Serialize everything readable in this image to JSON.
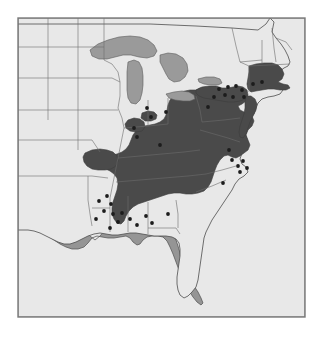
{
  "figure": {
    "type": "distribution-map",
    "region": "Eastern United States",
    "frame": {
      "x": 18,
      "y": 18,
      "width": 287,
      "height": 299
    },
    "canvas": {
      "width": 322,
      "height": 337
    }
  },
  "colors": {
    "page_background": "#ffffff",
    "ocean": "#959595",
    "land_unshaded": "#e8e8e8",
    "range_shaded": "#4a4a4a",
    "great_lakes": "#9a9a9a",
    "outline": "#4d4d4d",
    "state_border": "#6b6b6b",
    "frame_border": "#7a7a7a",
    "locality_dot": "#1c1c1c"
  },
  "legend": {
    "shaded_meaning": "Continuous distribution range (shaded dark)",
    "dot_meaning": "Isolated locality records (black dots)",
    "lake_meaning": "Great Lakes (medium gray)",
    "ocean_meaning": "Atlantic Ocean and Gulf of Mexico (medium gray)"
  },
  "map_data": {
    "shaded_states_full": [
      "Connecticut",
      "Rhode Island",
      "Massachusetts",
      "New Jersey",
      "Delaware",
      "Maryland",
      "West Virginia",
      "Kentucky",
      "Tennessee"
    ],
    "shaded_states_partial": [
      "New York",
      "Pennsylvania",
      "Ohio",
      "Indiana",
      "Illinois",
      "Virginia",
      "North Carolina",
      "South Carolina",
      "Georgia",
      "Alabama",
      "Mississippi",
      "Missouri",
      "Arkansas"
    ],
    "unshaded_states": [
      "Maine",
      "New Hampshire",
      "Vermont",
      "Michigan",
      "Wisconsin",
      "Minnesota",
      "Iowa",
      "Florida",
      "Louisiana",
      "Texas",
      "Oklahoma",
      "Kansas",
      "Nebraska",
      "South Dakota",
      "North Dakota"
    ],
    "great_lakes": [
      "Lake Superior",
      "Lake Michigan",
      "Lake Huron",
      "Lake Erie",
      "Lake Ontario"
    ],
    "locality_dot_count": 38,
    "locality_dots": [
      {
        "id": "dot-ny-01",
        "x": 219,
        "y": 89
      },
      {
        "id": "dot-ny-02",
        "x": 228,
        "y": 87
      },
      {
        "id": "dot-ny-03",
        "x": 236,
        "y": 86
      },
      {
        "id": "dot-ny-04",
        "x": 242,
        "y": 90
      },
      {
        "id": "dot-ny-05",
        "x": 225,
        "y": 95
      },
      {
        "id": "dot-ny-06",
        "x": 233,
        "y": 97
      },
      {
        "id": "dot-ny-07",
        "x": 214,
        "y": 97
      },
      {
        "id": "dot-ny-08",
        "x": 244,
        "y": 97
      },
      {
        "id": "dot-mi-01",
        "x": 147,
        "y": 108
      },
      {
        "id": "dot-in-01",
        "x": 151,
        "y": 117
      },
      {
        "id": "dot-il-01",
        "x": 134,
        "y": 128
      },
      {
        "id": "dot-il-02",
        "x": 137,
        "y": 137
      },
      {
        "id": "dot-ar-01",
        "x": 107,
        "y": 196
      },
      {
        "id": "dot-ar-02",
        "x": 99,
        "y": 201
      },
      {
        "id": "dot-ar-03",
        "x": 111,
        "y": 204
      },
      {
        "id": "dot-ms-01",
        "x": 104,
        "y": 211
      },
      {
        "id": "dot-ms-02",
        "x": 113,
        "y": 214
      },
      {
        "id": "dot-ms-03",
        "x": 122,
        "y": 213
      },
      {
        "id": "dot-ms-04",
        "x": 118,
        "y": 222
      },
      {
        "id": "dot-ms-05",
        "x": 110,
        "y": 228
      },
      {
        "id": "dot-al-01",
        "x": 130,
        "y": 219
      },
      {
        "id": "dot-al-02",
        "x": 137,
        "y": 225
      },
      {
        "id": "dot-al-03",
        "x": 146,
        "y": 216
      },
      {
        "id": "dot-al-04",
        "x": 152,
        "y": 223
      },
      {
        "id": "dot-la-01",
        "x": 96,
        "y": 219
      },
      {
        "id": "dot-nc-01",
        "x": 232,
        "y": 160
      },
      {
        "id": "dot-nc-02",
        "x": 238,
        "y": 166
      },
      {
        "id": "dot-nc-03",
        "x": 243,
        "y": 161
      },
      {
        "id": "dot-nc-04",
        "x": 240,
        "y": 172
      },
      {
        "id": "dot-nc-05",
        "x": 247,
        "y": 168
      },
      {
        "id": "dot-va-01",
        "x": 229,
        "y": 150
      },
      {
        "id": "dot-sc-01",
        "x": 223,
        "y": 183
      },
      {
        "id": "dot-ma-01",
        "x": 253,
        "y": 84
      },
      {
        "id": "dot-ma-02",
        "x": 262,
        "y": 82
      },
      {
        "id": "dot-pa-01",
        "x": 208,
        "y": 107
      },
      {
        "id": "dot-oh-01",
        "x": 166,
        "y": 112
      },
      {
        "id": "dot-ky-01",
        "x": 160,
        "y": 145
      },
      {
        "id": "dot-ga-01",
        "x": 168,
        "y": 214
      }
    ]
  }
}
